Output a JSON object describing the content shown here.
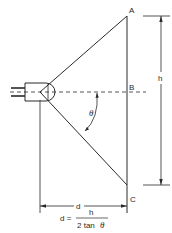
{
  "diagram": {
    "points": {
      "a": "A",
      "b": "B",
      "c": "C"
    },
    "angle_label": "θ",
    "height_label": "h",
    "distance_label": "d",
    "formula": {
      "lhs": "d =",
      "numerator": "h",
      "denominator_prefix": "2 tan",
      "denominator_var": "θ"
    },
    "line_color": "#2a2a2a"
  }
}
